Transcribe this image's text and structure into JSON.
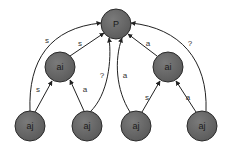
{
  "colors": {
    "node_fill": "#6b6b6b",
    "node_stroke": "#2a2a2a",
    "edge": "#222222",
    "background": "#ffffff"
  },
  "nodes": [
    {
      "id": "P",
      "label": "P",
      "cx": 116,
      "cy": 24,
      "r": 15
    },
    {
      "id": "ai1",
      "label": "ai",
      "cx": 60,
      "cy": 67,
      "r": 15
    },
    {
      "id": "ai2",
      "label": "ai",
      "cx": 168,
      "cy": 67,
      "r": 15
    },
    {
      "id": "aj1",
      "label": "aj",
      "cx": 30,
      "cy": 126,
      "r": 15
    },
    {
      "id": "aj2",
      "label": "aj",
      "cx": 87,
      "cy": 126,
      "r": 15
    },
    {
      "id": "aj3",
      "label": "aj",
      "cx": 136,
      "cy": 126,
      "r": 15
    },
    {
      "id": "aj4",
      "label": "aj",
      "cx": 202,
      "cy": 126,
      "r": 15
    }
  ],
  "edges": [
    {
      "from": "aj1",
      "to": "P",
      "label": "s",
      "path": "M30 111 C 28 60, 50 28, 101 23",
      "lx": 47,
      "ly": 40
    },
    {
      "from": "aj1",
      "to": "ai1",
      "label": "s",
      "path": "M35 112 L 52 81",
      "lx": 38,
      "ly": 89
    },
    {
      "from": "ai1",
      "to": "P",
      "label": "s",
      "path": "M70 56 L 104 33",
      "lx": 80,
      "ly": 43
    },
    {
      "from": "aj2",
      "to": "ai1",
      "label": "a",
      "path": "M84 111 L 70 80",
      "lx": 85,
      "ly": 89
    },
    {
      "from": "aj2",
      "to": "P",
      "label": "?",
      "path": "M90 112 C 108 95, 112 60, 109 38",
      "lx": 102,
      "ly": 75
    },
    {
      "from": "aj3",
      "to": "P",
      "label": "a",
      "path": "M130 112 C 116 90, 114 60, 122 38",
      "lx": 125,
      "ly": 75
    },
    {
      "from": "aj3",
      "to": "ai2",
      "label": "s",
      "path": "M142 112 L 160 81",
      "lx": 147,
      "ly": 97
    },
    {
      "from": "ai2",
      "to": "P",
      "label": "a",
      "path": "M157 56 L 128 34",
      "lx": 148,
      "ly": 43
    },
    {
      "from": "aj4",
      "to": "ai2",
      "label": "a",
      "path": "M196 112 L 176 81",
      "lx": 188,
      "ly": 97
    },
    {
      "from": "aj4",
      "to": "P",
      "label": "?",
      "path": "M206 111 C 208 60, 180 28, 131 23",
      "lx": 190,
      "ly": 43
    }
  ]
}
